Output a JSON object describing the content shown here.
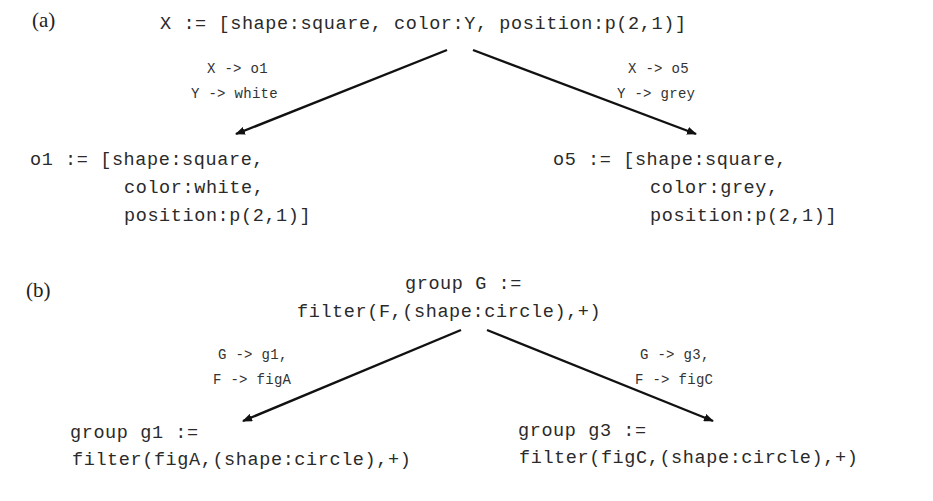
{
  "panel_a": {
    "label": "(a)",
    "root": "X := [shape:square, color:Y, position:p(2,1)]",
    "left_edge": {
      "line1": "X -> o1",
      "line2": "Y -> white"
    },
    "right_edge": {
      "line1": "X -> o5",
      "line2": "Y -> grey"
    },
    "left_node": {
      "line1": "o1 := [shape:square,",
      "line2": "color:white,",
      "line3": "position:p(2,1)]"
    },
    "right_node": {
      "line1": "o5 := [shape:square,",
      "line2": "color:grey,",
      "line3": "position:p(2,1)]"
    }
  },
  "panel_b": {
    "label": "(b)",
    "root": {
      "line1": "group G :=",
      "line2": "filter(F,(shape:circle),+)"
    },
    "left_edge": {
      "line1": "G -> g1,",
      "line2": "F -> figA"
    },
    "right_edge": {
      "line1": "G -> g3,",
      "line2": "F -> figC"
    },
    "left_node": {
      "line1": "group g1 :=",
      "line2": "filter(figA,(shape:circle),+)"
    },
    "right_node": {
      "line1": "group g3 :=",
      "line2": "filter(figC,(shape:circle),+)"
    }
  }
}
